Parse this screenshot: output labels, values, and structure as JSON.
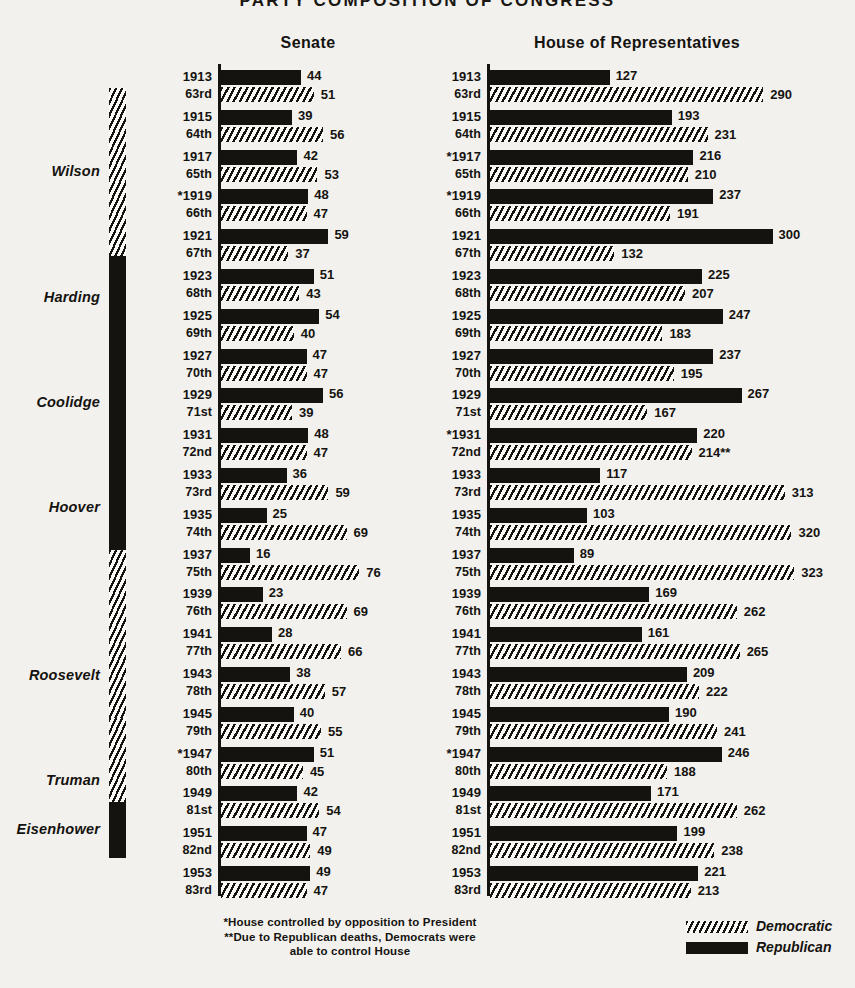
{
  "title": "PARTY COMPOSITION OF CONGRESS",
  "headers": {
    "senate": "Senate",
    "house": "House of Representatives"
  },
  "legend": {
    "items": [
      {
        "label": "Democratic",
        "swatch": "hatched-swatch",
        "color": "#15130f"
      },
      {
        "label": "Republican",
        "swatch": "solid-black-swatch",
        "color": "#15130f"
      }
    ]
  },
  "footnotes": [
    "*House controlled by opposition to President",
    "**Due to Republican deaths, Democrats were",
    "able to control House"
  ],
  "presidents": [
    {
      "name": "Wilson",
      "party": "Democratic",
      "top": 88,
      "height": 168
    },
    {
      "name": "Harding",
      "party": "Republican",
      "top": 256,
      "height": 84
    },
    {
      "name": "Coolidge",
      "party": "Republican",
      "top": 340,
      "height": 126
    },
    {
      "name": "Hoover",
      "party": "Republican",
      "top": 466,
      "height": 84
    },
    {
      "name": "Roosevelt",
      "party": "Democratic",
      "top": 550,
      "height": 252
    },
    {
      "name": "Truman",
      "party": "Democratic",
      "top": 718,
      "height": 126
    },
    {
      "name": "Eisenhower",
      "party": "Republican",
      "top": 802,
      "height": 56
    }
  ],
  "chart_data": {
    "type": "bar",
    "title": "PARTY COMPOSITION OF CONGRESS",
    "xlabel": "",
    "ylabel": "",
    "grid": false,
    "legend_position": "bottom-right",
    "series": [
      {
        "name": "Republican",
        "style": "solid-black"
      },
      {
        "name": "Democratic",
        "style": "diagonal-hatch"
      }
    ],
    "panels": [
      {
        "name": "Senate",
        "axis_max": 80,
        "px_per_unit": 1.82,
        "rows": [
          {
            "year": "1913",
            "congress": "63rd",
            "republican": 44,
            "democratic": 51,
            "asterisk": false
          },
          {
            "year": "1915",
            "congress": "64th",
            "republican": 39,
            "democratic": 56,
            "asterisk": false
          },
          {
            "year": "1917",
            "congress": "65th",
            "republican": 42,
            "democratic": 53,
            "asterisk": false
          },
          {
            "year": "*1919",
            "congress": "66th",
            "republican": 48,
            "democratic": 47,
            "asterisk": true
          },
          {
            "year": "1921",
            "congress": "67th",
            "republican": 59,
            "democratic": 37,
            "asterisk": false
          },
          {
            "year": "1923",
            "congress": "68th",
            "republican": 51,
            "democratic": 43,
            "asterisk": false
          },
          {
            "year": "1925",
            "congress": "69th",
            "republican": 54,
            "democratic": 40,
            "asterisk": false
          },
          {
            "year": "1927",
            "congress": "70th",
            "republican": 47,
            "democratic": 47,
            "asterisk": false
          },
          {
            "year": "1929",
            "congress": "71st",
            "republican": 56,
            "democratic": 39,
            "asterisk": false
          },
          {
            "year": "1931",
            "congress": "72nd",
            "republican": 48,
            "democratic": 47,
            "asterisk": false
          },
          {
            "year": "1933",
            "congress": "73rd",
            "republican": 36,
            "democratic": 59,
            "asterisk": false
          },
          {
            "year": "1935",
            "congress": "74th",
            "republican": 25,
            "democratic": 69,
            "asterisk": false
          },
          {
            "year": "1937",
            "congress": "75th",
            "republican": 16,
            "democratic": 76,
            "asterisk": false
          },
          {
            "year": "1939",
            "congress": "76th",
            "republican": 23,
            "democratic": 69,
            "asterisk": false
          },
          {
            "year": "1941",
            "congress": "77th",
            "republican": 28,
            "democratic": 66,
            "asterisk": false
          },
          {
            "year": "1943",
            "congress": "78th",
            "republican": 38,
            "democratic": 57,
            "asterisk": false
          },
          {
            "year": "1945",
            "congress": "79th",
            "republican": 40,
            "democratic": 55,
            "asterisk": false
          },
          {
            "year": "*1947",
            "congress": "80th",
            "republican": 51,
            "democratic": 45,
            "asterisk": true
          },
          {
            "year": "1949",
            "congress": "81st",
            "republican": 42,
            "democratic": 54,
            "asterisk": false
          },
          {
            "year": "1951",
            "congress": "82nd",
            "republican": 47,
            "democratic": 49,
            "asterisk": false
          },
          {
            "year": "1953",
            "congress": "83rd",
            "republican": 49,
            "democratic": 47,
            "asterisk": false
          }
        ]
      },
      {
        "name": "House of Representatives",
        "axis_max": 340,
        "px_per_unit": 0.942,
        "rows": [
          {
            "year": "1913",
            "congress": "63rd",
            "republican": 127,
            "democratic": 290,
            "rep_label": "127",
            "dem_label": "290",
            "asterisk": false
          },
          {
            "year": "1915",
            "congress": "64th",
            "republican": 193,
            "democratic": 231,
            "rep_label": "193",
            "dem_label": "231",
            "asterisk": false
          },
          {
            "year": "*1917",
            "congress": "65th",
            "republican": 216,
            "democratic": 210,
            "rep_label": "216",
            "dem_label": "210",
            "asterisk": true
          },
          {
            "year": "*1919",
            "congress": "66th",
            "republican": 237,
            "democratic": 191,
            "rep_label": "237",
            "dem_label": "191",
            "asterisk": true
          },
          {
            "year": "1921",
            "congress": "67th",
            "republican": 300,
            "democratic": 132,
            "rep_label": "300",
            "dem_label": "132",
            "asterisk": false
          },
          {
            "year": "1923",
            "congress": "68th",
            "republican": 225,
            "democratic": 207,
            "rep_label": "225",
            "dem_label": "207",
            "asterisk": false
          },
          {
            "year": "1925",
            "congress": "69th",
            "republican": 247,
            "democratic": 183,
            "rep_label": "247",
            "dem_label": "183",
            "asterisk": false
          },
          {
            "year": "1927",
            "congress": "70th",
            "republican": 237,
            "democratic": 195,
            "rep_label": "237",
            "dem_label": "195",
            "asterisk": false
          },
          {
            "year": "1929",
            "congress": "71st",
            "republican": 267,
            "democratic": 167,
            "rep_label": "267",
            "dem_label": "167",
            "asterisk": false
          },
          {
            "year": "*1931",
            "congress": "72nd",
            "republican": 220,
            "democratic": 214,
            "rep_label": "220",
            "dem_label": "214**",
            "asterisk": true
          },
          {
            "year": "1933",
            "congress": "73rd",
            "republican": 117,
            "democratic": 313,
            "rep_label": "117",
            "dem_label": "313",
            "asterisk": false
          },
          {
            "year": "1935",
            "congress": "74th",
            "republican": 103,
            "democratic": 320,
            "rep_label": "103",
            "dem_label": "320",
            "asterisk": false
          },
          {
            "year": "1937",
            "congress": "75th",
            "republican": 89,
            "democratic": 323,
            "rep_label": "89",
            "dem_label": "323",
            "asterisk": false
          },
          {
            "year": "1939",
            "congress": "76th",
            "republican": 169,
            "democratic": 262,
            "rep_label": "169",
            "dem_label": "262",
            "asterisk": false
          },
          {
            "year": "1941",
            "congress": "77th",
            "republican": 161,
            "democratic": 265,
            "rep_label": "161",
            "dem_label": "265",
            "asterisk": false
          },
          {
            "year": "1943",
            "congress": "78th",
            "republican": 209,
            "democratic": 222,
            "rep_label": "209",
            "dem_label": "222",
            "asterisk": false
          },
          {
            "year": "1945",
            "congress": "79th",
            "republican": 190,
            "democratic": 241,
            "rep_label": "190",
            "dem_label": "241",
            "asterisk": false
          },
          {
            "year": "*1947",
            "congress": "80th",
            "republican": 246,
            "democratic": 188,
            "rep_label": "246",
            "dem_label": "188",
            "asterisk": true
          },
          {
            "year": "1949",
            "congress": "81st",
            "republican": 171,
            "democratic": 262,
            "rep_label": "171",
            "dem_label": "262",
            "asterisk": false
          },
          {
            "year": "1951",
            "congress": "82nd",
            "republican": 199,
            "democratic": 238,
            "rep_label": "199",
            "dem_label": "238",
            "asterisk": false
          },
          {
            "year": "1953",
            "congress": "83rd",
            "republican": 221,
            "democratic": 213,
            "rep_label": "221",
            "dem_label": "213",
            "asterisk": false
          }
        ]
      }
    ]
  }
}
